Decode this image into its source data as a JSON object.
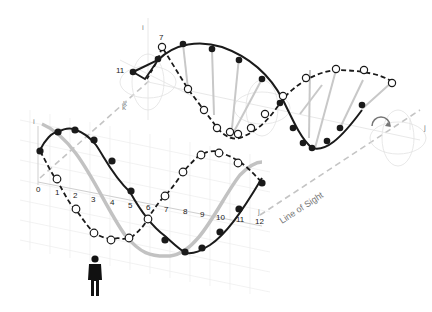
{
  "diagram": {
    "title": "",
    "colors": {
      "solid_wave": "#1a1a1a",
      "dashed_wave": "#1a1a1a",
      "open_marker_fill": "#ffffff",
      "gray_wave": "#bdbdbd",
      "grid": "#e6e6e6",
      "axis": "#c8c8c8",
      "line_of_sight": "#bcbcbc",
      "viewer": "#111111"
    },
    "lower_panel": {
      "axis_labels": {
        "vertical": "i",
        "depth": "k",
        "horizontal": "j"
      },
      "tick_labels": [
        "0",
        "1",
        "2",
        "3",
        "4",
        "5",
        "6",
        "7",
        "8",
        "9",
        "10",
        "11",
        "12"
      ]
    },
    "upper_panel": {
      "axis_labels": {
        "vertical": "i",
        "depth": "k",
        "horizontal": "j"
      },
      "point_labels": [
        "7",
        "11"
      ]
    },
    "line_of_sight_label": "Line of Sight",
    "legend_hint": {
      "solid_wave": "filled markers, solid line",
      "dashed_wave": "open markers, dashed line",
      "gray_wave": "resultant / projection"
    },
    "viewer": "person-icon"
  }
}
